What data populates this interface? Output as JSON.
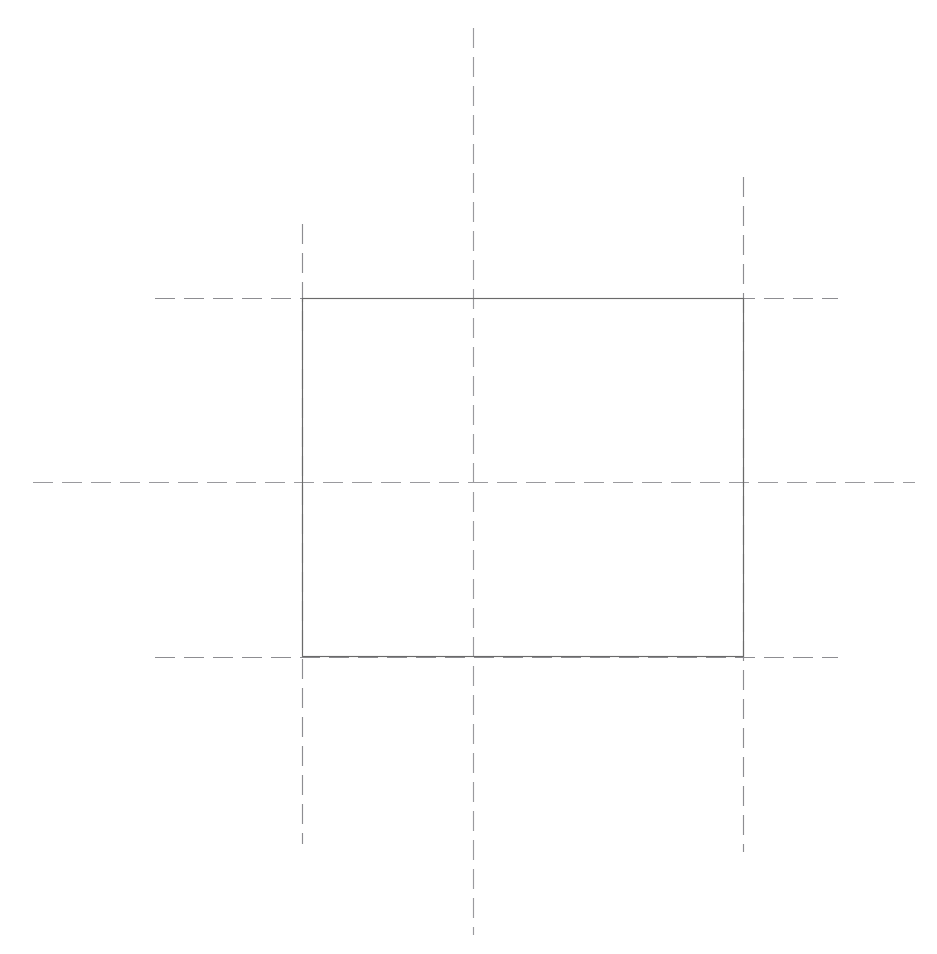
{
  "drawing": {
    "title": "Technical line drawing",
    "description": "Rectangle outline with dashed construction centerlines",
    "background_color": "#ffffff",
    "canvas": {
      "width": 937,
      "height": 954
    },
    "colors": {
      "solid_line": "#6a6a6a",
      "dashed_line": "#8d8d91",
      "center_line": "#9a9a9e"
    },
    "line_style": {
      "stroke_width": 1.15,
      "dash_length": 20,
      "gap_length": 9
    },
    "rectangle": {
      "name": "square-outline",
      "x": 302,
      "y": 298,
      "width": 442,
      "height": 359,
      "style": "solid"
    },
    "guides": [
      {
        "name": "vertical-centerline",
        "orientation": "vertical",
        "position": 473.5,
        "start": 28,
        "end": 935,
        "style": "dashed"
      },
      {
        "name": "horizontal-centerline",
        "orientation": "horizontal",
        "position": 482.5,
        "start": 33,
        "end": 915,
        "style": "dashed"
      },
      {
        "name": "left-edge-extension",
        "orientation": "vertical",
        "position": 302.5,
        "start": 224,
        "end": 844,
        "style": "dashed"
      },
      {
        "name": "right-edge-extension",
        "orientation": "vertical",
        "position": 743.5,
        "start": 177,
        "end": 852,
        "style": "dashed"
      },
      {
        "name": "top-edge-extension",
        "orientation": "horizontal",
        "position": 298.5,
        "start": 155,
        "end": 838,
        "style": "dashed"
      },
      {
        "name": "bottom-edge-extension",
        "orientation": "horizontal",
        "position": 657.5,
        "start": 155,
        "end": 838,
        "style": "dashed"
      }
    ]
  }
}
